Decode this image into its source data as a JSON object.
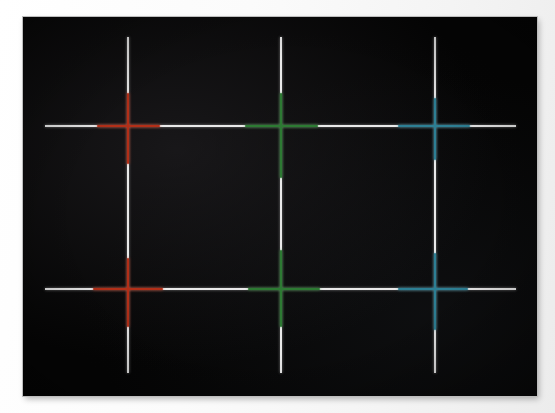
{
  "scene": {
    "title": "Display Crosshair Convergence Test Pattern",
    "surface_label": "photo-paper-background",
    "panel_label": "black-display-panel",
    "background_color": "#f4f4f4",
    "panel_color": "#050505",
    "panel_border_color": "#bdbdbd"
  },
  "panel": {
    "x": 23,
    "y": 17,
    "width": 514,
    "height": 379
  },
  "chart_data": {
    "type": "scatter",
    "xlabel": "",
    "ylabel": "",
    "grid": true,
    "legend_position": "none",
    "background": "#050505",
    "base_line_color": "#e9e9e9",
    "base_line_width": 2,
    "xlim": [
      23,
      537
    ],
    "ylim": [
      17,
      396
    ],
    "vertical_lines": [
      {
        "name": "vline-1",
        "x": 127,
        "y_start": 37,
        "y_end": 373,
        "color": "#e9e9e9"
      },
      {
        "name": "vline-2",
        "x": 280,
        "y_start": 37,
        "y_end": 373,
        "color": "#e9e9e9"
      },
      {
        "name": "vline-3",
        "x": 434,
        "y_start": 37,
        "y_end": 373,
        "color": "#e9e9e9"
      }
    ],
    "horizontal_lines": [
      {
        "name": "hline-1",
        "y": 125,
        "x_start": 45,
        "x_end": 516,
        "color": "#e9e9e9"
      },
      {
        "name": "hline-2",
        "y": 288,
        "x_start": 45,
        "x_end": 516,
        "color": "#e9e9e9"
      }
    ],
    "crosshairs": [
      {
        "name": "crosshair-red-top",
        "color": "#b22f18",
        "color_name": "red",
        "center_x": 127,
        "center_y": 125,
        "h_start": 97,
        "h_end": 160,
        "v_start": 93,
        "v_end": 164
      },
      {
        "name": "crosshair-green-top",
        "color": "#2d7a33",
        "color_name": "green",
        "center_x": 280,
        "center_y": 125,
        "h_start": 245,
        "h_end": 318,
        "v_start": 93,
        "v_end": 178
      },
      {
        "name": "crosshair-blue-top",
        "color": "#2d7f94",
        "color_name": "blue",
        "center_x": 434,
        "center_y": 125,
        "h_start": 398,
        "h_end": 470,
        "v_start": 98,
        "v_end": 160
      },
      {
        "name": "crosshair-red-bottom",
        "color": "#b22f18",
        "color_name": "red",
        "center_x": 127,
        "center_y": 288,
        "h_start": 93,
        "h_end": 163,
        "v_start": 258,
        "v_end": 327
      },
      {
        "name": "crosshair-green-bottom",
        "color": "#2d7a33",
        "color_name": "green",
        "center_x": 280,
        "center_y": 288,
        "h_start": 248,
        "h_end": 320,
        "v_start": 250,
        "v_end": 327
      },
      {
        "name": "crosshair-blue-bottom",
        "color": "#2d7f94",
        "color_name": "blue",
        "center_x": 434,
        "center_y": 288,
        "h_start": 398,
        "h_end": 468,
        "v_start": 253,
        "v_end": 330
      }
    ],
    "colors": {
      "red": "#b22f18",
      "green": "#2d7a33",
      "blue": "#2d7f94",
      "white": "#e9e9e9",
      "black": "#050505"
    }
  }
}
